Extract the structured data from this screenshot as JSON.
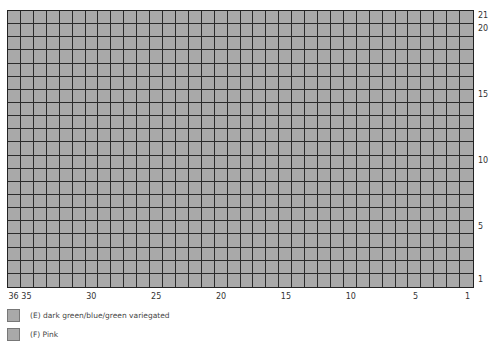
{
  "chart": {
    "columns": 36,
    "rows": 21,
    "cell_color": "#a9a9a9",
    "gridline_color": "#2a2a2a",
    "row_labels": [
      {
        "label": "21",
        "row": 21
      },
      {
        "label": "20",
        "row": 20
      },
      {
        "label": "15",
        "row": 15
      },
      {
        "label": "10",
        "row": 10
      },
      {
        "label": "5",
        "row": 5
      },
      {
        "label": "1",
        "row": 1
      }
    ],
    "column_labels": [
      {
        "label": "36",
        "col": 36
      },
      {
        "label": "35",
        "col": 35
      },
      {
        "label": "30",
        "col": 30
      },
      {
        "label": "25",
        "col": 25
      },
      {
        "label": "20",
        "col": 20
      },
      {
        "label": "15",
        "col": 15
      },
      {
        "label": "10",
        "col": 10
      },
      {
        "label": "5",
        "col": 5
      },
      {
        "label": "1",
        "col": 1
      }
    ]
  },
  "legend": [
    {
      "code": "E",
      "label": "(E) dark green/blue/green variegated",
      "color": "#a9a9a9"
    },
    {
      "code": "F",
      "label": "(F) Pink",
      "color": "#a9a9a9"
    }
  ]
}
